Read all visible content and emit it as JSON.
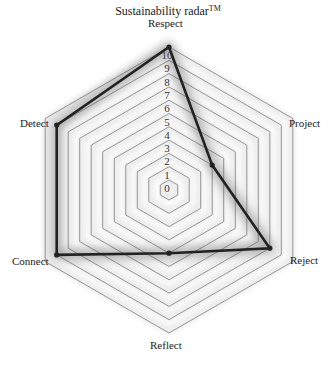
{
  "chart_data": {
    "type": "radar",
    "title": "Sustainability radar",
    "title_superscript": "TM",
    "axes": [
      "Respect",
      "Project",
      "Reject",
      "Reflect",
      "Connect",
      "Detect"
    ],
    "series": [
      {
        "name": "Assessment",
        "values": [
          10,
          3,
          8,
          4,
          9,
          9
        ]
      }
    ],
    "scale": {
      "min": 0,
      "max": 10,
      "step": 1
    },
    "tick_labels": [
      "0",
      "1",
      "2",
      "3",
      "4",
      "5",
      "6",
      "7",
      "8",
      "9",
      "10"
    ],
    "grid": "hexagonal rings",
    "legend": "none"
  },
  "labels": {
    "title": "Sustainability radar",
    "title_sup": "TM",
    "respect": "Respect",
    "project": "Project",
    "reject": "Reject",
    "reflect": "Reflect",
    "connect": "Connect",
    "detect": "Detect"
  },
  "colors": {
    "line": "#222222",
    "grid": "#8a8a8a",
    "shadow": "#9a9a9a",
    "background": "#ffffff"
  }
}
